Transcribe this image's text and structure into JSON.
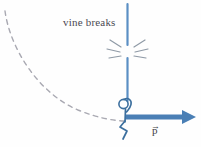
{
  "figure": {
    "type": "physics-diagram",
    "title": "vine breaks",
    "background_color": "#fefefe",
    "width": 201,
    "height": 147,
    "annotations": {
      "vine_breaks_label": "vine breaks",
      "momentum_label": "p",
      "momentum_vector_bar": "→"
    },
    "colors": {
      "vine": "#5b8fc4",
      "momentum_arrow": "#4a7fb5",
      "figure_outline": "#3c6f9e",
      "trajectory_dash": "#a9a9b2",
      "break_marks": "#8f9aa6",
      "text": "#4a4a52"
    },
    "elements": {
      "vine": {
        "name": "vine",
        "orientation": "vertical",
        "x": 127,
        "y_top": 4,
        "y_bottom": 101,
        "break_point_y": 52
      },
      "break_marks": {
        "name": "break-marks",
        "count": 6,
        "center_x": 127,
        "center_y": 52
      },
      "stick_figure": {
        "name": "stick-figure",
        "head_cx": 124,
        "head_cy": 104,
        "head_r": 4.5
      },
      "momentum_arrow": {
        "name": "momentum-arrow",
        "x_start": 128,
        "x_end": 194,
        "y": 117,
        "direction": "right"
      },
      "trajectory": {
        "name": "projectile-trajectory",
        "style": "dashed",
        "from": [
          4,
          12
        ],
        "to": [
          126,
          120
        ]
      }
    }
  }
}
